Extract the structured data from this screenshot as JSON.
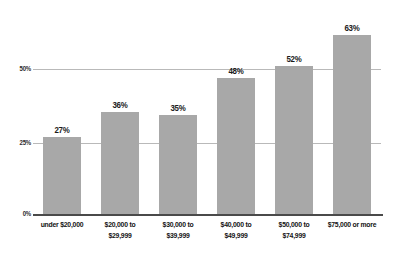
{
  "chart_data": {
    "type": "bar",
    "title": "",
    "subtitle": "",
    "xlabel": "",
    "ylabel": "",
    "categories": [
      "under $20,000",
      "$20,000 to $29,999",
      "$30,000 to $39,999",
      "$40,000 to $49,999",
      "$50,000 to $74,999",
      "$75,000 or more"
    ],
    "category_lines": [
      [
        "under $20,000",
        ""
      ],
      [
        "$20,000 to",
        "$29,999"
      ],
      [
        "$30,000 to",
        "$39,999"
      ],
      [
        "$40,000 to",
        "$49,999"
      ],
      [
        "$50,000 to",
        "$74,999"
      ],
      [
        "$75,000 or more",
        ""
      ]
    ],
    "values": [
      27,
      36,
      35,
      48,
      52,
      63
    ],
    "value_labels": [
      "27%",
      "36%",
      "35%",
      "48%",
      "52%",
      "63%"
    ],
    "ylim": [
      0,
      75
    ],
    "yticks": [
      0,
      25,
      50
    ],
    "ytick_labels": [
      "0%",
      "25%",
      "50%"
    ],
    "grid": true,
    "legend": "none",
    "bar_color": "#a8a8a8",
    "gridline_color": "#b9b9b9",
    "axis_color": "#4a4a4a",
    "text_color": "#131313",
    "background_color": "#ffffff"
  },
  "axis": {
    "tick_0": "0%",
    "tick_25": "25%",
    "tick_50": "50%"
  },
  "bars": [
    {
      "label_line1": "under $20,000",
      "label_line2": "",
      "value_label": "27%"
    },
    {
      "label_line1": "$20,000 to",
      "label_line2": "$29,999",
      "value_label": "36%"
    },
    {
      "label_line1": "$30,000 to",
      "label_line2": "$39,999",
      "value_label": "35%"
    },
    {
      "label_line1": "$40,000 to",
      "label_line2": "$49,999",
      "value_label": "48%"
    },
    {
      "label_line1": "$50,000 to",
      "label_line2": "$74,999",
      "value_label": "52%"
    },
    {
      "label_line1": "$75,000 or more",
      "label_line2": "",
      "value_label": "63%"
    }
  ]
}
